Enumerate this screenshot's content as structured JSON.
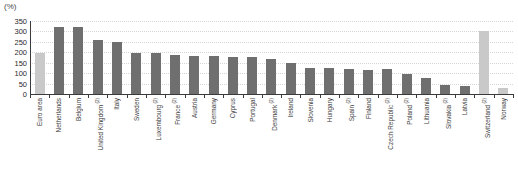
{
  "unit": "(%)",
  "chart_data": {
    "type": "bar",
    "title": "",
    "subtitle": "",
    "xlabel": "",
    "ylabel": "(%)",
    "ylim": [
      0,
      350
    ],
    "ytick_step": 50,
    "yticks": [
      350,
      300,
      250,
      200,
      150,
      100,
      50,
      0
    ],
    "grid": true,
    "legend": false,
    "categories": [
      "Euro area",
      "Netherlands",
      "Belgium",
      "United Kingdom",
      "Italy",
      "Sweden",
      "Luxembourg",
      "France",
      "Austria",
      "Germany",
      "Cyprus",
      "Portugal",
      "Denmark",
      "Ireland",
      "Slovenia",
      "Hungary",
      "Spain",
      "Finland",
      "Czech Republic",
      "Poland",
      "Lithuania",
      "Slovakia",
      "Latvia",
      "Switzerland",
      "Norway"
    ],
    "category_footnotes": [
      "",
      "",
      "",
      "2",
      "",
      "",
      "2",
      "2",
      "",
      "",
      "",
      "",
      "2",
      "",
      "",
      "",
      "2",
      "",
      "2",
      "2",
      "",
      "2",
      "",
      "2",
      ""
    ],
    "values": [
      195,
      322,
      321,
      261,
      248,
      199,
      198,
      186,
      184,
      181,
      178,
      176,
      166,
      148,
      127,
      123,
      122,
      117,
      120,
      94,
      76,
      45,
      39,
      301,
      29
    ],
    "series": [
      {
        "name": "Total assets",
        "values": [
          195,
          322,
          321,
          261,
          248,
          199,
          198,
          186,
          184,
          181,
          178,
          176,
          166,
          148,
          127,
          123,
          122,
          117,
          120,
          94,
          76,
          45,
          39,
          301,
          29
        ]
      }
    ],
    "bar_colors": [
      "#c9c9c9",
      "#6f6f6f",
      "#6f6f6f",
      "#6f6f6f",
      "#6f6f6f",
      "#6f6f6f",
      "#6f6f6f",
      "#6f6f6f",
      "#6f6f6f",
      "#6f6f6f",
      "#6f6f6f",
      "#6f6f6f",
      "#6f6f6f",
      "#6f6f6f",
      "#6f6f6f",
      "#6f6f6f",
      "#6f6f6f",
      "#6f6f6f",
      "#6f6f6f",
      "#6f6f6f",
      "#6f6f6f",
      "#6f6f6f",
      "#6f6f6f",
      "#c9c9c9",
      "#c9c9c9"
    ],
    "colors": {
      "bar_dark": "#6f6f6f",
      "bar_light": "#c9c9c9",
      "axis": "#3a3a3a",
      "grid": "#d9d4cf",
      "text": "#2b2b2b",
      "background": "#ffffff"
    }
  }
}
